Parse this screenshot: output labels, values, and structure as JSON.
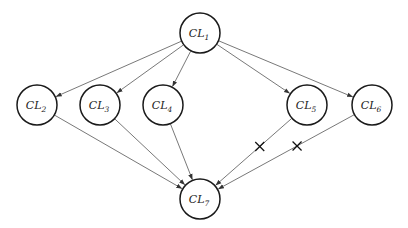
{
  "diagram": {
    "type": "directed-graph",
    "nodes": [
      {
        "id": "CL1",
        "label": "CL",
        "sub": "1",
        "x": 200,
        "y": 33
      },
      {
        "id": "CL2",
        "label": "CL",
        "sub": "2",
        "x": 37,
        "y": 105
      },
      {
        "id": "CL3",
        "label": "CL",
        "sub": "3",
        "x": 100,
        "y": 105
      },
      {
        "id": "CL4",
        "label": "CL",
        "sub": "4",
        "x": 163,
        "y": 105
      },
      {
        "id": "CL5",
        "label": "CL",
        "sub": "5",
        "x": 307,
        "y": 105
      },
      {
        "id": "CL6",
        "label": "CL",
        "sub": "6",
        "x": 372,
        "y": 105
      },
      {
        "id": "CL7",
        "label": "CL",
        "sub": "7",
        "x": 200,
        "y": 199
      }
    ],
    "edges": [
      {
        "from": "CL1",
        "to": "CL2",
        "cut": false
      },
      {
        "from": "CL1",
        "to": "CL3",
        "cut": false
      },
      {
        "from": "CL1",
        "to": "CL4",
        "cut": false
      },
      {
        "from": "CL1",
        "to": "CL5",
        "cut": false
      },
      {
        "from": "CL1",
        "to": "CL6",
        "cut": false
      },
      {
        "from": "CL2",
        "to": "CL7",
        "cut": false
      },
      {
        "from": "CL3",
        "to": "CL7",
        "cut": false
      },
      {
        "from": "CL4",
        "to": "CL7",
        "cut": false
      },
      {
        "from": "CL5",
        "to": "CL7",
        "cut": true
      },
      {
        "from": "CL6",
        "to": "CL7",
        "cut": true
      }
    ],
    "node_radius": 20,
    "colors": {
      "stroke": "#1a1a1a",
      "edge": "#555555",
      "background": "#ffffff"
    }
  }
}
